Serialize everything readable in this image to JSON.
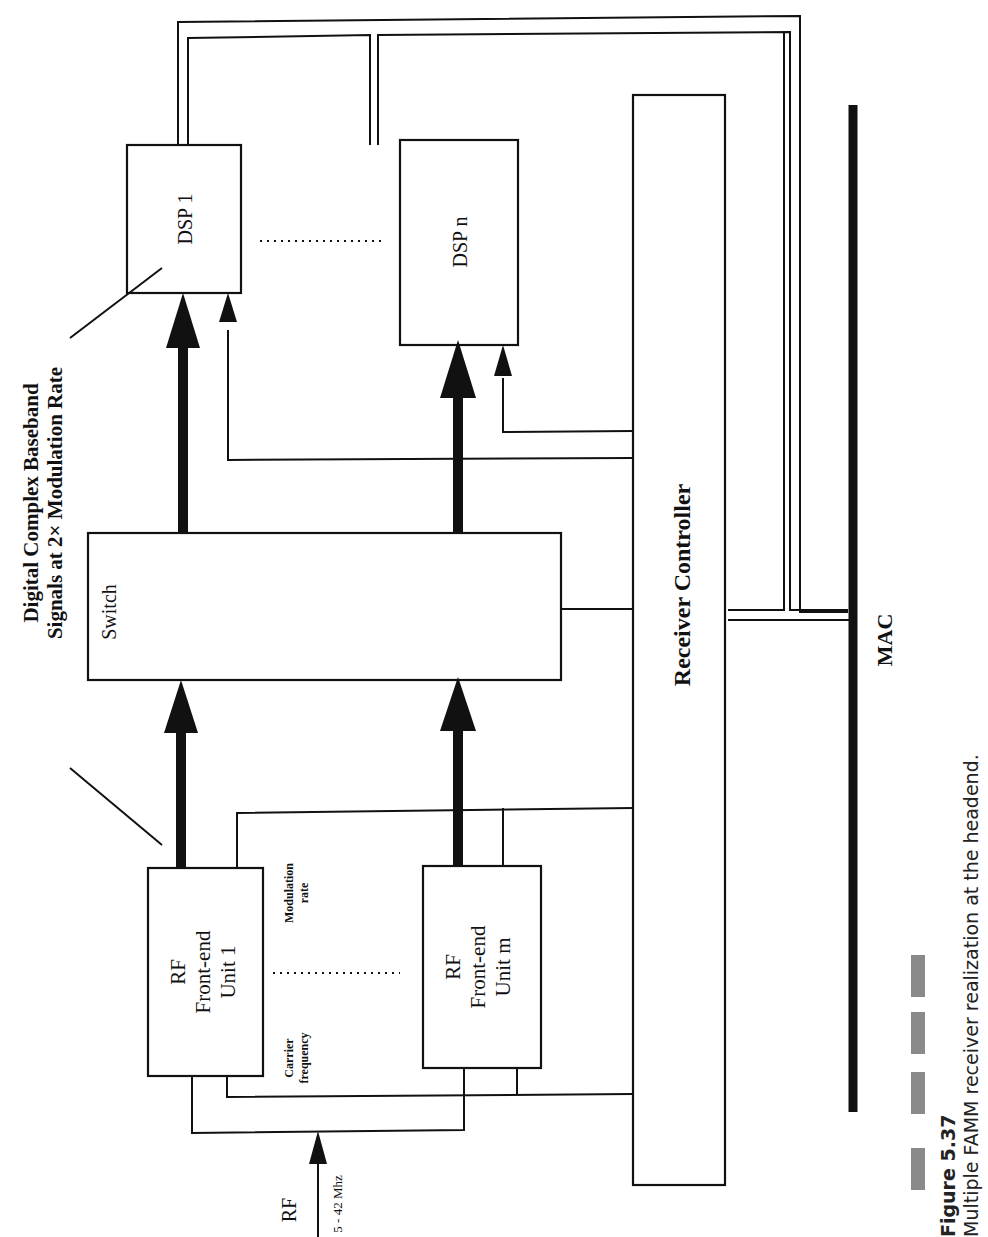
{
  "diagram": {
    "orientation": "rotated-90-ccw",
    "blocks": {
      "dsp_1": "DSP 1",
      "dsp_n": "DSP n",
      "switch": "Switch",
      "rf_unit_1": [
        "RF",
        "Front-end",
        "Unit 1"
      ],
      "rf_unit_m": [
        "RF",
        "Front-end",
        "Unit m"
      ],
      "receiver_controller": "Receiver Controller",
      "mac": "MAC"
    },
    "labels": {
      "baseband_line1": "Digital Complex Baseband",
      "baseband_line2": "Signals at 2× Modulation Rate",
      "modulation_rate_line1": "Modulation",
      "modulation_rate_line2": "rate",
      "carrier_frequency_line1": "Carrier",
      "carrier_frequency_line2": "frequency",
      "rf_input": "RF",
      "rf_input_range": "5 - 42 Mhz"
    },
    "colors": {
      "ink": "#111111",
      "caption_bar": "#8a8a8a"
    }
  },
  "caption": {
    "figure_number": "Figure 5.37",
    "text": "Multiple FAMM receiver realization at the headend."
  }
}
